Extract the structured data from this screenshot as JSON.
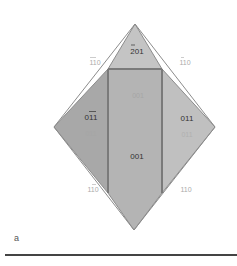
{
  "figure": {
    "panel_label": "a",
    "colors": {
      "face_top": "#c4c4c4",
      "face_left": "#a8a8a8",
      "face_center": "#b4b4b4",
      "face_right": "#c0c0c0",
      "edge": "#8c8c8c",
      "edge_dark": "#7a7a7a",
      "label_dark": "#333333",
      "label_light": "#aaaaaa",
      "label_faint": "#a6a6a6",
      "rule": "#444444"
    },
    "faces": [
      {
        "id": "top",
        "label": "201",
        "bar": [
          0
        ],
        "style": "dark"
      },
      {
        "id": "left",
        "label": "011",
        "bar": [
          1,
          2
        ],
        "style": "dark"
      },
      {
        "id": "right",
        "label": "011",
        "bar": [],
        "style": "dark"
      },
      {
        "id": "center",
        "label": "001",
        "bar": [],
        "style": "dark"
      }
    ],
    "back_labels": [
      {
        "id": "back-center",
        "label": "001",
        "style": "faint",
        "uncertain": true
      },
      {
        "id": "back-left",
        "label": "011",
        "style": "faint",
        "uncertain": true
      },
      {
        "id": "back-right",
        "label": "011",
        "style": "faint",
        "uncertain": true
      }
    ],
    "edge_labels": [
      {
        "id": "upper-left",
        "label": "110",
        "bar": [
          0,
          1
        ]
      },
      {
        "id": "upper-right",
        "label": "110",
        "bar": [
          0
        ]
      },
      {
        "id": "lower-left",
        "label": "110",
        "bar": [
          1
        ]
      },
      {
        "id": "lower-right",
        "label": "110",
        "bar": []
      }
    ]
  }
}
